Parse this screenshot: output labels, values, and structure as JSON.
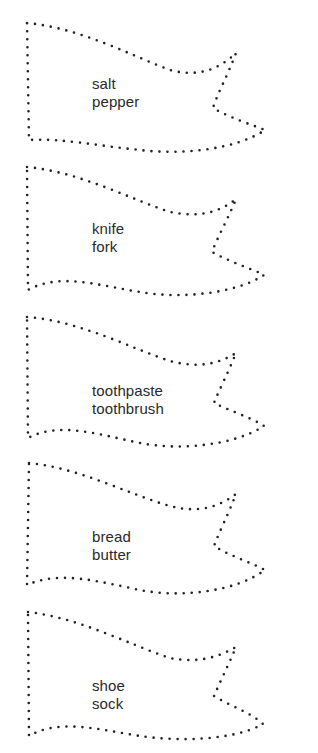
{
  "worksheet": {
    "flags": [
      {
        "line1": "salt",
        "line2": "pepper"
      },
      {
        "line1": "knife",
        "line2": "fork"
      },
      {
        "line1": "toothpaste",
        "line2": "toothbrush"
      },
      {
        "line1": "bread",
        "line2": "butter"
      },
      {
        "line1": "shoe",
        "line2": "sock"
      }
    ],
    "outline_color": "#222222",
    "text_color": "#2a2a2a"
  }
}
